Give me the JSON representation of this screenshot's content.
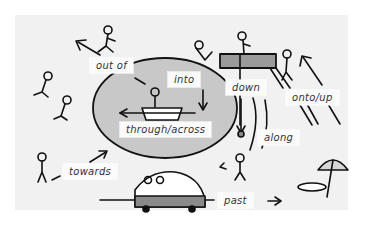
{
  "diagram": {
    "colors": {
      "background": "#ffffff",
      "panel": "#f1f1f1",
      "pool": "#c8c8c8",
      "ink": "#111111",
      "label_bg": "#fbfbfb",
      "bridge": "#9a9a9a"
    },
    "labels": [
      {
        "id": "out_of",
        "text": "out of"
      },
      {
        "id": "into",
        "text": "into"
      },
      {
        "id": "down",
        "text": "down"
      },
      {
        "id": "onto_up",
        "text": "onto/up"
      },
      {
        "id": "through_across",
        "text": "through/across"
      },
      {
        "id": "along",
        "text": "along"
      },
      {
        "id": "towards",
        "text": "towards"
      },
      {
        "id": "past",
        "text": "past"
      }
    ],
    "figures": [
      "person-running-out-of-pool",
      "person-diving-into-pool",
      "person-on-bridge",
      "person-climbing-steps",
      "person-in-boat",
      "person-walking-along",
      "person-walking-towards",
      "people-in-car",
      "person-sunbathing",
      "beach-umbrella"
    ]
  }
}
